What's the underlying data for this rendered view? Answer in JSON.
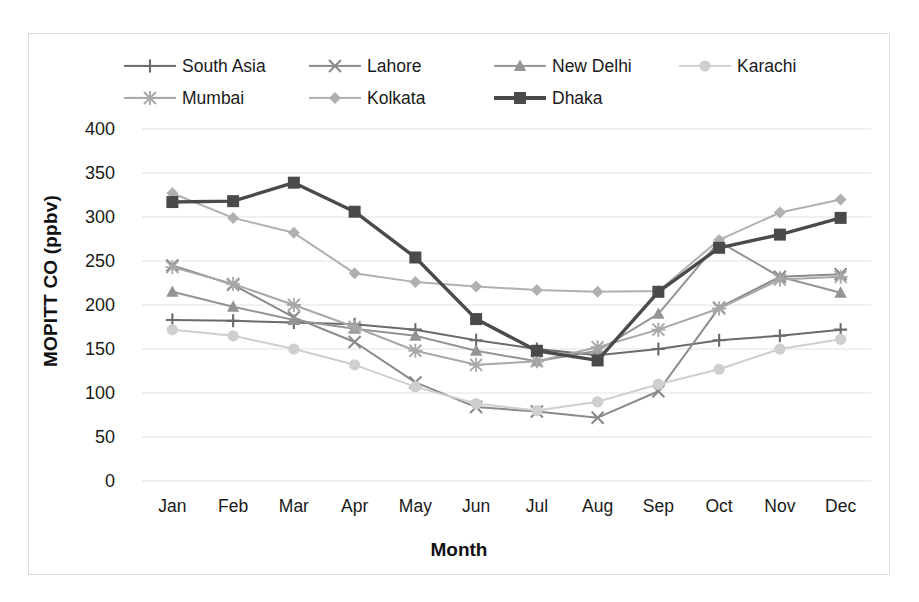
{
  "chart": {
    "type": "line",
    "ylabel": "MOPITT CO (ppbv)",
    "xlabel": "Month"
  },
  "axis": {
    "yticks": [
      "400",
      "350",
      "300",
      "250",
      "200",
      "150",
      "100",
      "50",
      "0"
    ],
    "xticks": [
      "Jan",
      "Feb",
      "Mar",
      "Apr",
      "May",
      "Jun",
      "Jul",
      "Aug",
      "Sep",
      "Oct",
      "Nov",
      "Dec"
    ]
  },
  "legend": {
    "items": [
      {
        "label": "South Asia",
        "marker": "plus",
        "color": "#6b6b6b"
      },
      {
        "label": "Lahore",
        "marker": "x",
        "color": "#8a8a8a"
      },
      {
        "label": "New Delhi",
        "marker": "triangle",
        "color": "#949494"
      },
      {
        "label": "Karachi",
        "marker": "circle",
        "color": "#cfcfcf"
      },
      {
        "label": "Mumbai",
        "marker": "star",
        "color": "#a8a8a8"
      },
      {
        "label": "Kolkata",
        "marker": "diamond",
        "color": "#b0b0b0"
      },
      {
        "label": "Dhaka",
        "marker": "square",
        "color": "#4a4a4a"
      }
    ]
  },
  "chart_data": {
    "type": "line",
    "title": "",
    "xlabel": "Month",
    "ylabel": "MOPITT CO (ppbv)",
    "ylim": [
      0,
      400
    ],
    "ytick_step": 50,
    "grid": true,
    "legend_position": "top",
    "categories": [
      "Jan",
      "Feb",
      "Mar",
      "Apr",
      "May",
      "Jun",
      "Jul",
      "Aug",
      "Sep",
      "Oct",
      "Nov",
      "Dec"
    ],
    "series": [
      {
        "name": "South Asia",
        "marker": "plus",
        "color": "#6b6b6b",
        "values": [
          183,
          182,
          180,
          178,
          172,
          160,
          150,
          143,
          150,
          160,
          165,
          172
        ]
      },
      {
        "name": "Lahore",
        "marker": "x",
        "color": "#8a8a8a",
        "values": [
          245,
          223,
          186,
          158,
          112,
          84,
          79,
          72,
          102,
          197,
          232,
          235
        ]
      },
      {
        "name": "New Delhi",
        "marker": "triangle",
        "color": "#949494",
        "values": [
          215,
          198,
          183,
          173,
          165,
          148,
          136,
          148,
          190,
          272,
          232,
          214
        ]
      },
      {
        "name": "Karachi",
        "marker": "circle",
        "color": "#cfcfcf",
        "values": [
          172,
          165,
          150,
          132,
          107,
          88,
          80,
          90,
          110,
          127,
          150,
          161
        ]
      },
      {
        "name": "Mumbai",
        "marker": "star",
        "color": "#a8a8a8",
        "values": [
          243,
          224,
          200,
          175,
          148,
          132,
          136,
          152,
          172,
          196,
          229,
          232
        ]
      },
      {
        "name": "Kolkata",
        "marker": "diamond",
        "color": "#b0b0b0",
        "values": [
          327,
          299,
          282,
          236,
          226,
          221,
          217,
          215,
          216,
          274,
          305,
          320
        ]
      },
      {
        "name": "Dhaka",
        "marker": "square",
        "color": "#4a4a4a",
        "values": [
          317,
          318,
          339,
          306,
          254,
          184,
          148,
          137,
          215,
          265,
          280,
          299
        ]
      }
    ]
  }
}
